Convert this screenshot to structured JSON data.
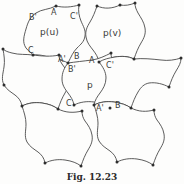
{
  "figure": {
    "caption": "Fig. 12.23",
    "background_color": "#fdfdfc",
    "stroke_color": "#4a4a4a",
    "vertex_color": "#2e2e2e",
    "label_color": "#3a3a3a"
  },
  "cell_labels": [
    {
      "id": "cell-pu",
      "text": "p(u)",
      "x": 40,
      "y": 28
    },
    {
      "id": "cell-pv",
      "text": "p(v)",
      "x": 103,
      "y": 29
    },
    {
      "id": "cell-p",
      "text": "p",
      "x": 87,
      "y": 81
    }
  ],
  "edge_labels": [
    {
      "id": "edge-b-prime-top",
      "text": "B'",
      "x": 29,
      "y": 14
    },
    {
      "id": "edge-a-top",
      "text": "A",
      "x": 51,
      "y": 9
    },
    {
      "id": "edge-c-prime-top",
      "text": "C'",
      "x": 70,
      "y": 13
    },
    {
      "id": "edge-c-left",
      "text": "C",
      "x": 28,
      "y": 47
    },
    {
      "id": "edge-a-prime-mid",
      "text": "A'",
      "x": 58,
      "y": 56
    },
    {
      "id": "edge-b-mid",
      "text": "B",
      "x": 74,
      "y": 53
    },
    {
      "id": "edge-a-mid",
      "text": "A",
      "x": 89,
      "y": 57
    },
    {
      "id": "edge-b-prime-mid",
      "text": "B'",
      "x": 68,
      "y": 66
    },
    {
      "id": "edge-c-prime-mid",
      "text": "C'",
      "x": 106,
      "y": 62
    },
    {
      "id": "edge-c-bottom",
      "text": "C",
      "x": 66,
      "y": 100
    },
    {
      "id": "edge-a-prime-bottom",
      "text": "A'",
      "x": 96,
      "y": 105
    },
    {
      "id": "edge-b-bottom",
      "text": "B",
      "x": 115,
      "y": 102
    }
  ],
  "tiles": [
    {
      "id": "tile-pu",
      "d": "M 56 6 C 48 10 42 9 36 13 C 30 17 28 22 26 29 C 24 36 22 42 26 48 C 29 52 32 53 33 55 C 41 54 47 57 55 59 C 60 60 65 61 68 63 C 71 57 73 52 77 48 C 81 44 84 42 85 36 C 86 30 83 26 81 21 C 79 16 78 11 79 5 C 72 7 64 8 56 6 Z"
    },
    {
      "id": "tile-pv",
      "d": "M 120 5 C 112 9 104 9 97 6 C 95 12 93 17 90 22 C 87 27 85 31 86 37 C 87 43 90 46 93 50 C 96 54 98 57 99 62 C 104 59 109 58 115 57 C 122 56 128 56 134 59 C 136 53 138 48 141 43 C 144 38 146 34 145 28 C 144 22 141 18 138 13 C 136 9 135 7 135 3 C 130 5 125 6 120 5 Z"
    },
    {
      "id": "tile-left",
      "d": "M 33 55 C 26 54 19 55 12 53 C 8 52 5 51 3 49 C 4 55 5 61 4 67 C 3 74 1 79 4 85 C 7 90 11 92 15 95 C 19 98 21 101 22 106 C 28 103 35 102 42 103 C 49 104 54 106 58 109 C 60 103 62 98 65 93 C 68 88 70 84 69 78 C 68 72 65 68 62 64 C 60 61 59 58 59 55 C 51 57 41 56 33 55 Z"
    },
    {
      "id": "tile-center",
      "d": "M 68 63 C 64 68 62 73 62 79 C 62 85 65 89 68 93 C 71 97 73 100 74 105 C 80 102 87 101 94 102 C 101 103 106 105 110 108 C 112 102 114 97 117 92 C 120 87 122 83 121 77 C 120 71 117 67 114 63 C 112 60 111 57 111 53 C 105 56 99 59 92 60 C 84 61 75 62 68 63 Z"
    },
    {
      "id": "tile-right",
      "d": "M 134 59 C 128 56 121 56 115 57 C 109 58 104 59 99 62 C 103 67 106 72 106 78 C 106 84 103 89 100 93 C 97 97 95 100 94 105 C 100 102 107 101 114 102 C 121 103 127 105 131 108 C 133 102 135 97 138 92 C 141 87 144 84 149 83 C 156 82 163 84 169 87 C 171 81 173 76 176 71 C 179 66 181 63 181 58 C 175 60 168 61 161 60 C 152 59 142 58 134 59 Z"
    },
    {
      "id": "tile-bottom-left",
      "d": "M 58 109 C 54 106 49 104 42 103 C 35 102 28 103 22 106 C 24 112 26 118 26 124 C 26 131 24 136 27 142 C 30 147 34 149 38 152 C 42 155 44 158 45 163 C 51 160 58 159 65 160 C 72 161 77 163 81 166 C 83 160 85 155 88 150 C 91 145 93 141 92 135 C 91 129 88 125 85 121 C 83 118 82 115 82 111 C 74 113 66 113 58 109 Z"
    },
    {
      "id": "tile-bottom-right",
      "d": "M 131 108 C 127 105 121 103 114 102 C 107 101 100 102 94 105 C 96 111 98 117 98 123 C 98 130 96 135 99 141 C 102 146 106 148 110 151 C 114 154 116 157 117 162 C 123 159 130 158 137 159 C 144 160 149 162 153 165 C 155 159 157 154 160 149 C 163 144 165 140 164 134 C 163 128 160 124 157 120 C 155 117 154 114 154 110 C 146 112 139 112 131 108 Z"
    }
  ],
  "vertices": [
    {
      "x": 56,
      "y": 6
    },
    {
      "x": 79,
      "y": 5
    },
    {
      "x": 33,
      "y": 55
    },
    {
      "x": 68,
      "y": 63
    },
    {
      "x": 59,
      "y": 55
    },
    {
      "x": 97,
      "y": 6
    },
    {
      "x": 120,
      "y": 5
    },
    {
      "x": 135,
      "y": 3
    },
    {
      "x": 99,
      "y": 62
    },
    {
      "x": 111,
      "y": 53
    },
    {
      "x": 134,
      "y": 59
    },
    {
      "x": 3,
      "y": 49
    },
    {
      "x": 22,
      "y": 106
    },
    {
      "x": 58,
      "y": 109
    },
    {
      "x": 74,
      "y": 105
    },
    {
      "x": 94,
      "y": 105
    },
    {
      "x": 110,
      "y": 108
    },
    {
      "x": 131,
      "y": 108
    },
    {
      "x": 181,
      "y": 58
    },
    {
      "x": 169,
      "y": 87
    },
    {
      "x": 45,
      "y": 163
    },
    {
      "x": 81,
      "y": 166
    },
    {
      "x": 82,
      "y": 111
    },
    {
      "x": 117,
      "y": 162
    },
    {
      "x": 153,
      "y": 165
    },
    {
      "x": 154,
      "y": 110
    },
    {
      "x": 4,
      "y": 85
    }
  ],
  "caption_position": {
    "y": 172
  }
}
